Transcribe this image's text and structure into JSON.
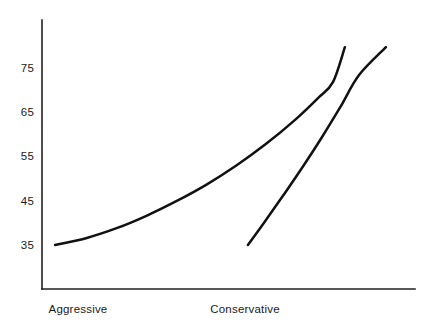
{
  "chart_data": {
    "type": "line",
    "title": "",
    "subtitle": "",
    "xlabel": "",
    "ylabel": "",
    "xlim": [
      0,
      100
    ],
    "ylim": [
      20,
      84
    ],
    "grid": false,
    "legend": null,
    "axis_color": "#231f20",
    "line_color": "#111111",
    "background": "#ffffff",
    "ytick_labels": [
      "75",
      "65",
      "55",
      "45",
      "35"
    ],
    "ytick_values": [
      75,
      65,
      55,
      45,
      35
    ],
    "xtick_labels": [
      "Aggressive",
      "Conservative"
    ],
    "series": [
      {
        "name": "curve-1",
        "points": [
          {
            "x": 3.5,
            "y": 35.0
          },
          {
            "x": 12.0,
            "y": 36.6
          },
          {
            "x": 20.0,
            "y": 38.8
          },
          {
            "x": 28.0,
            "y": 41.6
          },
          {
            "x": 36.0,
            "y": 44.9
          },
          {
            "x": 44.0,
            "y": 48.6
          },
          {
            "x": 52.0,
            "y": 52.9
          },
          {
            "x": 60.0,
            "y": 57.8
          },
          {
            "x": 68.0,
            "y": 63.4
          },
          {
            "x": 74.0,
            "y": 68.2
          },
          {
            "x": 78.0,
            "y": 71.8
          },
          {
            "x": 81.2,
            "y": 79.7
          }
        ]
      },
      {
        "name": "curve-2",
        "points": [
          {
            "x": 55.2,
            "y": 35.0
          },
          {
            "x": 60.0,
            "y": 40.6
          },
          {
            "x": 65.0,
            "y": 46.6
          },
          {
            "x": 70.0,
            "y": 52.8
          },
          {
            "x": 75.0,
            "y": 59.3
          },
          {
            "x": 80.0,
            "y": 66.2
          },
          {
            "x": 85.0,
            "y": 73.4
          },
          {
            "x": 92.2,
            "y": 79.7
          }
        ]
      }
    ]
  }
}
